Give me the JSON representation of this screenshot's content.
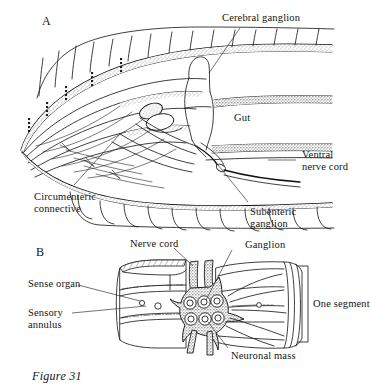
{
  "figure": {
    "caption": "Figure 31",
    "panels": [
      {
        "letter": "A",
        "description": "lateral sagittal view of anterior body showing cerebral ganglion, gut and ventral nerve cord"
      },
      {
        "letter": "B",
        "description": "three-dimensional cut-away of one body segment showing ganglion and neuronal masses"
      }
    ]
  },
  "panel_a": {
    "letter": "A",
    "labels": {
      "cerebral_ganglion": "Cerebral ganglion",
      "gut": "Gut",
      "ventral_nerve_cord_line1": "Ventral",
      "ventral_nerve_cord_line2": "nerve cord",
      "circumenteric_connective_line1": "Circumenteric",
      "circumenteric_connective_line2": "connective",
      "subenteric_ganglion_line1": "Subenteric",
      "subenteric_ganglion_line2": "ganglion"
    }
  },
  "panel_b": {
    "letter": "B",
    "labels": {
      "nerve_cord": "Nerve cord",
      "ganglion": "Ganglion",
      "sense_organ": "Sense organ",
      "sensory_annulus_line1": "Sensory",
      "sensory_annulus_line2": "annulus",
      "one_segment": "One segment",
      "neuronal_mass": "Neuronal mass"
    },
    "ganglion_neuron_count": 6
  },
  "colors": {
    "ink": "#1d1d1d",
    "paper": "#ffffff",
    "leader": "#262626",
    "stipple": "#3a3a3a"
  }
}
